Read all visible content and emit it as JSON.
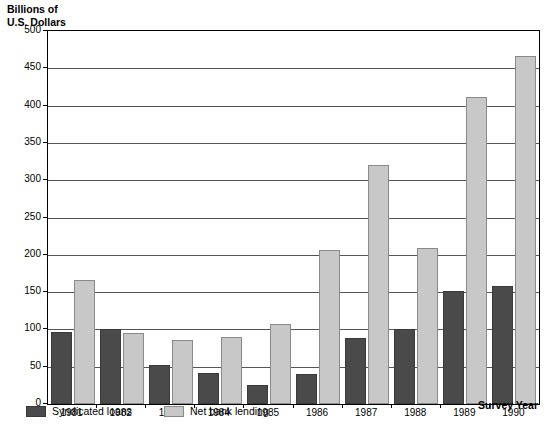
{
  "chart_data": {
    "type": "bar",
    "title": "",
    "ylabel": "Billions of\nU.S. Dollars",
    "xlabel": "Survey Year",
    "categories": [
      "1981",
      "1982",
      "1983",
      "1984",
      "1985",
      "1986",
      "1987",
      "1988",
      "1989",
      "1990"
    ],
    "series": [
      {
        "name": "Syndicated loans",
        "color": "#4a4a4a",
        "values": [
          97,
          100,
          52,
          42,
          25,
          40,
          89,
          101,
          151,
          158
        ]
      },
      {
        "name": "Net bank lending",
        "color": "#c8c8c8",
        "values": [
          166,
          95,
          86,
          90,
          107,
          207,
          321,
          209,
          412,
          467
        ]
      }
    ],
    "ylim": [
      0,
      500
    ],
    "ytick_step": 50,
    "yticks": [
      "0",
      "50",
      "100",
      "150",
      "200",
      "250",
      "300",
      "350",
      "400",
      "450",
      "500"
    ],
    "grid": true,
    "legend_position": "bottom-left"
  },
  "legend": {
    "items": [
      {
        "label": "Syndicated loans",
        "color": "#4a4a4a"
      },
      {
        "label": "Net bank lending",
        "color": "#c8c8c8"
      }
    ]
  }
}
